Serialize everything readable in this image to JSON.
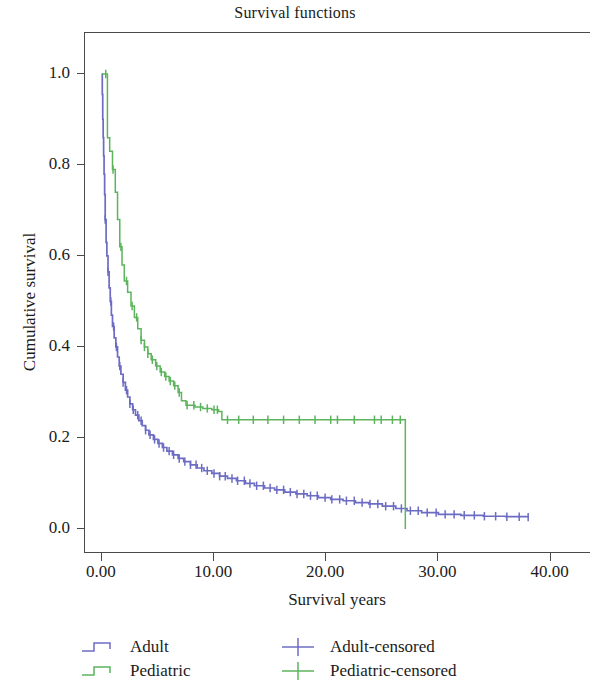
{
  "chart_data": {
    "type": "line",
    "title": "Survival functions",
    "xlabel": "Survival years",
    "ylabel": "Cumulative survival",
    "xlim": [
      -1.5,
      43.6
    ],
    "ylim": [
      -0.055,
      1.09
    ],
    "xticks": [
      "0.00",
      "10.00",
      "20.00",
      "30.00",
      "40.00"
    ],
    "xtick_values": [
      0,
      10,
      20,
      30,
      40
    ],
    "yticks": [
      "0.0",
      "0.2",
      "0.4",
      "0.6",
      "0.8",
      "1.0"
    ],
    "ytick_values": [
      0.0,
      0.2,
      0.4,
      0.6,
      0.8,
      1.0
    ],
    "grid": false,
    "legend_position": "below-plot",
    "series": [
      {
        "name": "Adult",
        "color": "#6c6cc4",
        "style": "step",
        "censored_name": "Adult-censored",
        "points": [
          [
            0.0,
            1.0
          ],
          [
            0.04,
            0.955
          ],
          [
            0.08,
            0.9
          ],
          [
            0.12,
            0.86
          ],
          [
            0.16,
            0.82
          ],
          [
            0.2,
            0.78
          ],
          [
            0.25,
            0.735
          ],
          [
            0.3,
            0.68
          ],
          [
            0.38,
            0.63
          ],
          [
            0.45,
            0.6
          ],
          [
            0.55,
            0.565
          ],
          [
            0.65,
            0.53
          ],
          [
            0.75,
            0.5
          ],
          [
            0.85,
            0.47
          ],
          [
            0.95,
            0.445
          ],
          [
            1.1,
            0.42
          ],
          [
            1.25,
            0.4
          ],
          [
            1.4,
            0.378
          ],
          [
            1.55,
            0.358
          ],
          [
            1.7,
            0.34
          ],
          [
            1.9,
            0.322
          ],
          [
            2.1,
            0.305
          ],
          [
            2.3,
            0.29
          ],
          [
            2.5,
            0.275
          ],
          [
            2.75,
            0.262
          ],
          [
            3.0,
            0.25
          ],
          [
            3.3,
            0.238
          ],
          [
            3.6,
            0.227
          ],
          [
            3.9,
            0.217
          ],
          [
            4.2,
            0.207
          ],
          [
            4.6,
            0.197
          ],
          [
            5.0,
            0.188
          ],
          [
            5.4,
            0.179
          ],
          [
            5.8,
            0.171
          ],
          [
            6.3,
            0.163
          ],
          [
            6.8,
            0.155
          ],
          [
            7.3,
            0.148
          ],
          [
            7.9,
            0.141
          ],
          [
            8.5,
            0.134
          ],
          [
            9.1,
            0.128
          ],
          [
            9.8,
            0.122
          ],
          [
            10.5,
            0.116
          ],
          [
            11.2,
            0.111
          ],
          [
            12.0,
            0.106
          ],
          [
            12.8,
            0.1
          ],
          [
            13.6,
            0.095
          ],
          [
            14.5,
            0.09
          ],
          [
            15.4,
            0.086
          ],
          [
            16.3,
            0.081
          ],
          [
            17.3,
            0.077
          ],
          [
            18.3,
            0.073
          ],
          [
            19.3,
            0.069
          ],
          [
            20.4,
            0.065
          ],
          [
            21.5,
            0.062
          ],
          [
            22.6,
            0.058
          ],
          [
            23.8,
            0.055
          ],
          [
            25.0,
            0.05
          ],
          [
            26.2,
            0.045
          ],
          [
            27.2,
            0.04
          ],
          [
            28.5,
            0.036
          ],
          [
            30.0,
            0.032
          ],
          [
            32.0,
            0.03
          ],
          [
            34.0,
            0.028
          ],
          [
            36.0,
            0.027
          ],
          [
            38.0,
            0.026
          ]
        ],
        "censored_x": [
          0.3,
          0.55,
          0.8,
          1.05,
          1.3,
          1.6,
          1.9,
          2.2,
          2.5,
          2.8,
          3.2,
          3.5,
          3.9,
          4.3,
          4.7,
          5.1,
          5.5,
          6.0,
          6.4,
          6.9,
          7.4,
          7.9,
          8.4,
          8.9,
          9.4,
          10.0,
          10.5,
          11.0,
          11.6,
          12.1,
          12.7,
          13.2,
          13.8,
          14.4,
          15.0,
          15.6,
          16.2,
          16.8,
          17.4,
          18.0,
          18.6,
          19.2,
          19.9,
          20.5,
          21.2,
          21.8,
          22.5,
          23.2,
          23.9,
          24.6,
          25.3,
          26.0,
          26.7,
          27.5,
          28.2,
          29.0,
          29.8,
          30.6,
          31.4,
          32.3,
          33.2,
          34.1,
          35.1,
          36.1,
          37.2,
          38.0
        ]
      },
      {
        "name": "Pediatric",
        "color": "#5cb45c",
        "style": "step",
        "censored_name": "Pediatric-censored",
        "points": [
          [
            0.0,
            1.0
          ],
          [
            0.5,
            0.86
          ],
          [
            0.7,
            0.83
          ],
          [
            0.95,
            0.79
          ],
          [
            1.2,
            0.74
          ],
          [
            1.4,
            0.68
          ],
          [
            1.6,
            0.62
          ],
          [
            1.8,
            0.58
          ],
          [
            2.0,
            0.545
          ],
          [
            2.3,
            0.52
          ],
          [
            2.6,
            0.49
          ],
          [
            2.9,
            0.465
          ],
          [
            3.2,
            0.44
          ],
          [
            3.5,
            0.415
          ],
          [
            3.8,
            0.4
          ],
          [
            4.1,
            0.385
          ],
          [
            4.4,
            0.372
          ],
          [
            4.8,
            0.358
          ],
          [
            5.2,
            0.345
          ],
          [
            5.6,
            0.335
          ],
          [
            6.0,
            0.325
          ],
          [
            6.4,
            0.315
          ],
          [
            6.8,
            0.3
          ],
          [
            7.1,
            0.282
          ],
          [
            7.5,
            0.272
          ],
          [
            8.3,
            0.268
          ],
          [
            9.0,
            0.265
          ],
          [
            9.8,
            0.262
          ],
          [
            10.4,
            0.258
          ],
          [
            10.7,
            0.24
          ],
          [
            12.5,
            0.24
          ],
          [
            15.0,
            0.24
          ],
          [
            18.0,
            0.24
          ],
          [
            21.0,
            0.24
          ],
          [
            24.0,
            0.24
          ],
          [
            27.0,
            0.24
          ],
          [
            27.05,
            0.0
          ]
        ],
        "censored_x": [
          0.35,
          1.0,
          1.7,
          2.2,
          2.7,
          3.1,
          3.5,
          3.8,
          4.1,
          4.5,
          4.9,
          5.3,
          5.7,
          6.1,
          6.5,
          6.9,
          7.6,
          8.2,
          8.8,
          9.4,
          10.0,
          10.3,
          11.2,
          12.2,
          13.5,
          14.8,
          16.2,
          17.6,
          19.0,
          20.4,
          21.0,
          22.5,
          24.3,
          24.9,
          25.9,
          26.6
        ]
      }
    ]
  },
  "legend": {
    "items": [
      {
        "label": "Adult",
        "color": "#6c6cc4",
        "symbol": "step-line",
        "row": 0,
        "col": 0
      },
      {
        "label": "Pediatric",
        "color": "#5cb45c",
        "symbol": "step-line",
        "row": 1,
        "col": 0
      },
      {
        "label": "Adult-censored",
        "color": "#6c6cc4",
        "symbol": "plus-mark",
        "row": 0,
        "col": 1
      },
      {
        "label": "Pediatric-censored",
        "color": "#5cb45c",
        "symbol": "plus-mark",
        "row": 1,
        "col": 1
      }
    ]
  },
  "colors": {
    "adult": "#6c6cc4",
    "pediatric": "#5cb45c",
    "axis": "#4a4a4a",
    "text": "#1b1b1b",
    "background": "#ffffff"
  }
}
